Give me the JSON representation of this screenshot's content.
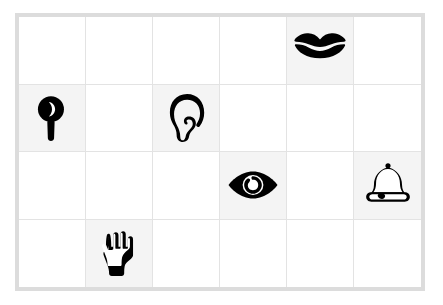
{
  "board": {
    "title": "Five Senses Icon Grid",
    "columns": 6,
    "rows": 4,
    "border_color": "#dcdcdc",
    "gridline_color": "#e3e3e3",
    "empty_cell_color": "#ffffff",
    "filled_cell_color": "#f4f4f4",
    "icon_color": "#000000",
    "background_color": "#ffffff"
  },
  "cells": [
    {
      "row": 1,
      "col": 1,
      "icon": null,
      "label": ""
    },
    {
      "row": 1,
      "col": 2,
      "icon": null,
      "label": ""
    },
    {
      "row": 1,
      "col": 3,
      "icon": null,
      "label": ""
    },
    {
      "row": 1,
      "col": 4,
      "icon": null,
      "label": ""
    },
    {
      "row": 1,
      "col": 5,
      "icon": "lips-icon",
      "label": "Lips"
    },
    {
      "row": 1,
      "col": 6,
      "icon": null,
      "label": ""
    },
    {
      "row": 2,
      "col": 1,
      "icon": "magnifying-glass-icon",
      "label": "Magnifying glass"
    },
    {
      "row": 2,
      "col": 2,
      "icon": null,
      "label": ""
    },
    {
      "row": 2,
      "col": 3,
      "icon": "ear-icon",
      "label": "Ear"
    },
    {
      "row": 2,
      "col": 4,
      "icon": null,
      "label": ""
    },
    {
      "row": 2,
      "col": 5,
      "icon": null,
      "label": ""
    },
    {
      "row": 2,
      "col": 6,
      "icon": null,
      "label": ""
    },
    {
      "row": 3,
      "col": 1,
      "icon": null,
      "label": ""
    },
    {
      "row": 3,
      "col": 2,
      "icon": null,
      "label": ""
    },
    {
      "row": 3,
      "col": 3,
      "icon": null,
      "label": ""
    },
    {
      "row": 3,
      "col": 4,
      "icon": "eye-icon",
      "label": "Eye"
    },
    {
      "row": 3,
      "col": 5,
      "icon": null,
      "label": ""
    },
    {
      "row": 3,
      "col": 6,
      "icon": "bell-icon",
      "label": "Bell"
    },
    {
      "row": 4,
      "col": 1,
      "icon": null,
      "label": ""
    },
    {
      "row": 4,
      "col": 2,
      "icon": "hand-icon",
      "label": "Hand"
    },
    {
      "row": 4,
      "col": 3,
      "icon": null,
      "label": ""
    },
    {
      "row": 4,
      "col": 4,
      "icon": null,
      "label": ""
    },
    {
      "row": 4,
      "col": 5,
      "icon": null,
      "label": ""
    },
    {
      "row": 4,
      "col": 6,
      "icon": null,
      "label": ""
    }
  ]
}
